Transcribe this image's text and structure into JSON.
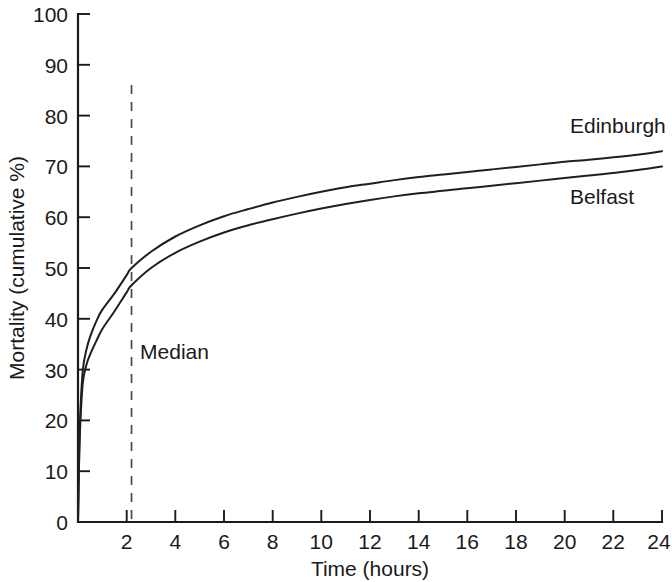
{
  "chart_data": {
    "type": "line",
    "title": "",
    "xlabel": "Time (hours)",
    "ylabel": "Mortality (cumulative %)",
    "xlim": [
      0,
      24
    ],
    "ylim": [
      0,
      100
    ],
    "grid": false,
    "legend_position": "inline-right-end-labels",
    "x_ticks": [
      0,
      2,
      4,
      6,
      8,
      10,
      12,
      14,
      16,
      18,
      20,
      22,
      24
    ],
    "x_tick_labels": [
      "0",
      "2",
      "4",
      "6",
      "8",
      "10",
      "12",
      "14",
      "16",
      "18",
      "20",
      "22",
      "24"
    ],
    "y_ticks": [
      0,
      10,
      20,
      30,
      40,
      50,
      60,
      70,
      80,
      90,
      100
    ],
    "y_tick_labels": [
      "0",
      "10",
      "20",
      "30",
      "40",
      "50",
      "60",
      "70",
      "80",
      "90",
      "100"
    ],
    "x": [
      0,
      0.05,
      0.1,
      0.2,
      0.35,
      0.5,
      0.75,
      1,
      1.5,
      2,
      2.2,
      3,
      4,
      5,
      6,
      7,
      8,
      9,
      10,
      11,
      12,
      13,
      14,
      15,
      16,
      17,
      18,
      19,
      20,
      21,
      22,
      23,
      24
    ],
    "series": [
      {
        "name": "Edinburgh",
        "label": "Edinburgh",
        "color": "#1f1f1f",
        "values": [
          0,
          14,
          22,
          30,
          34,
          36.5,
          39.5,
          41.8,
          45,
          48.6,
          50,
          53.2,
          56.2,
          58.4,
          60.2,
          61.6,
          62.9,
          64,
          65,
          65.9,
          66.6,
          67.3,
          67.9,
          68.4,
          68.9,
          69.4,
          69.9,
          70.4,
          70.9,
          71.3,
          71.8,
          72.3,
          73
        ]
      },
      {
        "name": "Belfast",
        "label": "Belfast",
        "color": "#1f1f1f",
        "values": [
          0,
          13,
          20,
          27.5,
          31,
          33,
          35.6,
          38,
          41.5,
          45.2,
          46.6,
          50,
          53,
          55.2,
          57,
          58.4,
          59.6,
          60.7,
          61.7,
          62.6,
          63.4,
          64.1,
          64.7,
          65.2,
          65.7,
          66.2,
          66.7,
          67.2,
          67.7,
          68.2,
          68.7,
          69.3,
          70
        ]
      }
    ],
    "annotations": [
      {
        "name": "median",
        "label": "Median",
        "type": "vertical-dashed-line",
        "x": 2.2,
        "y_top": 86,
        "y_bottom": 0,
        "label_x": 2.55,
        "label_y": 32
      }
    ]
  }
}
